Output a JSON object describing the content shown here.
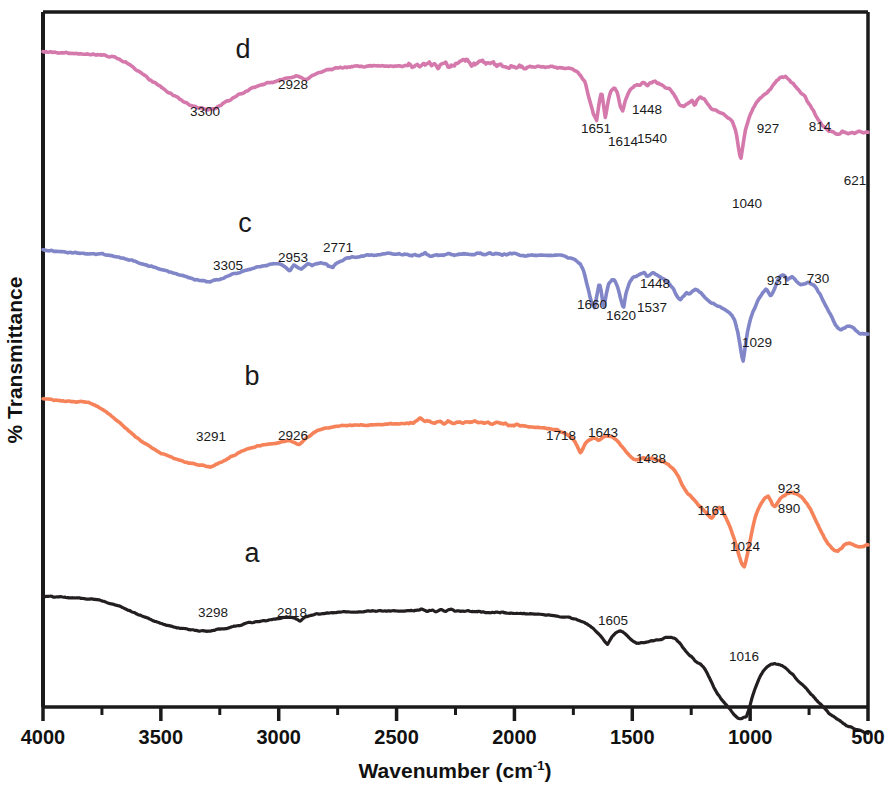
{
  "chart_data": {
    "type": "line",
    "title": "",
    "xlabel": "Wavenumber (cm-1)",
    "xlabel_base": "Wavenumber (cm",
    "xlabel_sup": "-1",
    "xlabel_close": ")",
    "ylabel": "% Transmittance",
    "xlim": [
      4000,
      500
    ],
    "x_reversed": true,
    "xticks": [
      4000,
      3500,
      3000,
      2500,
      2000,
      1500,
      1000,
      500
    ],
    "xticklabels": [
      "4000",
      "3500",
      "3000",
      "2500",
      "2000",
      "1500",
      "1000",
      "500"
    ],
    "x_minor_ticks": [
      3750,
      3250,
      2750,
      2250,
      1750,
      1250,
      750
    ],
    "yticks": [],
    "yticklabels": [],
    "grid": false,
    "legend_position": "inline-letters",
    "note": "Stacked FTIR transmittance spectra, four offset traces labelled a-d",
    "series": [
      {
        "name": "a",
        "letter": "a",
        "color": "#231f20",
        "offset_label_x": 2740,
        "annotations": [
          {
            "wavenumber": 3298,
            "label": "3298"
          },
          {
            "wavenumber": 2918,
            "label": "2918"
          },
          {
            "wavenumber": 1605,
            "label": "1605"
          },
          {
            "wavenumber": 1016,
            "label": "1016"
          }
        ]
      },
      {
        "name": "b",
        "letter": "b",
        "color": "#f58259",
        "offset_label_x": 2740,
        "annotations": [
          {
            "wavenumber": 3291,
            "label": "3291"
          },
          {
            "wavenumber": 2926,
            "label": "2926"
          },
          {
            "wavenumber": 1718,
            "label": "1718"
          },
          {
            "wavenumber": 1643,
            "label": "1643"
          },
          {
            "wavenumber": 1438,
            "label": "1438"
          },
          {
            "wavenumber": 1161,
            "label": "1161"
          },
          {
            "wavenumber": 1024,
            "label": "1024"
          },
          {
            "wavenumber": 923,
            "label": "923"
          },
          {
            "wavenumber": 890,
            "label": "890"
          }
        ]
      },
      {
        "name": "c",
        "letter": "c",
        "color": "#8186c8",
        "offset_label_x": 2740,
        "annotations": [
          {
            "wavenumber": 3305,
            "label": "3305"
          },
          {
            "wavenumber": 2953,
            "label": "2953"
          },
          {
            "wavenumber": 2771,
            "label": "2771"
          },
          {
            "wavenumber": 1660,
            "label": "1660"
          },
          {
            "wavenumber": 1620,
            "label": "1620"
          },
          {
            "wavenumber": 1537,
            "label": "1537"
          },
          {
            "wavenumber": 1448,
            "label": "1448"
          },
          {
            "wavenumber": 1029,
            "label": "1029"
          },
          {
            "wavenumber": 931,
            "label": "931"
          },
          {
            "wavenumber": 730,
            "label": "730"
          }
        ]
      },
      {
        "name": "d",
        "letter": "d",
        "color": "#d579ad",
        "offset_label_x": 2740,
        "annotations": [
          {
            "wavenumber": 3300,
            "label": "3300"
          },
          {
            "wavenumber": 2928,
            "label": "2928"
          },
          {
            "wavenumber": 1651,
            "label": "1651"
          },
          {
            "wavenumber": 1614,
            "label": "1614"
          },
          {
            "wavenumber": 1540,
            "label": "1540"
          },
          {
            "wavenumber": 1448,
            "label": "1448"
          },
          {
            "wavenumber": 1040,
            "label": "1040"
          },
          {
            "wavenumber": 927,
            "label": "927"
          },
          {
            "wavenumber": 814,
            "label": "814"
          },
          {
            "wavenumber": 621,
            "label": "621"
          }
        ]
      }
    ]
  }
}
